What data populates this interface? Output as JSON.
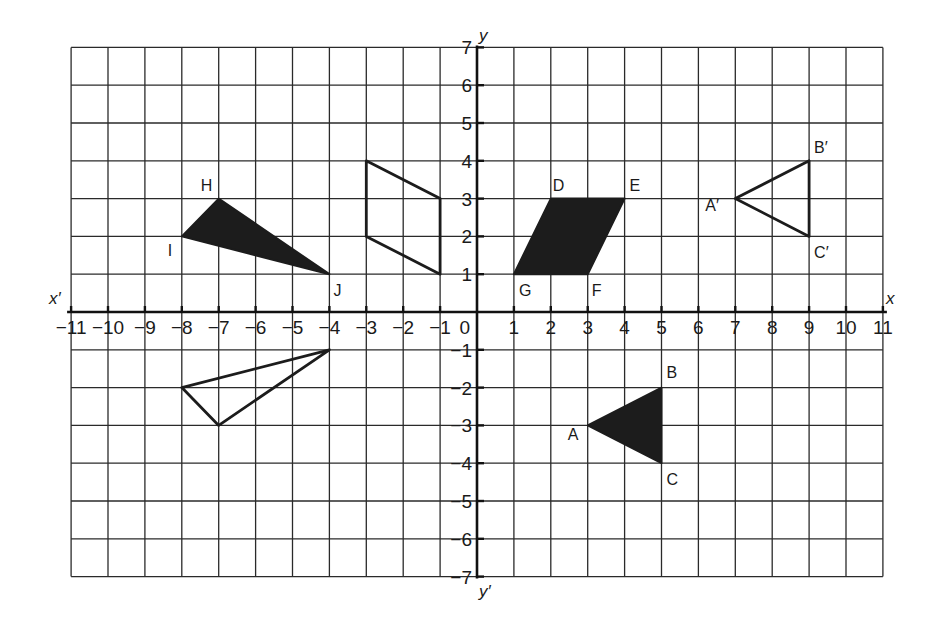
{
  "diagram": {
    "type": "coordinate-plane-transformations",
    "axes": {
      "x_label": "x",
      "x_neg_label": "x′",
      "y_label": "y",
      "y_neg_label": "y′",
      "origin_label": "0",
      "x_range": [
        -11,
        11
      ],
      "y_range": [
        -7,
        7
      ],
      "x_ticks": [
        "−11",
        "−10",
        "−9",
        "−8",
        "−7",
        "−6",
        "−5",
        "−4",
        "−3",
        "−2",
        "−1",
        "1",
        "2",
        "3",
        "4",
        "5",
        "6",
        "7",
        "8",
        "9",
        "10",
        "11"
      ],
      "y_ticks": [
        "7",
        "6",
        "5",
        "4",
        "3",
        "2",
        "1",
        "−1",
        "−2",
        "−3",
        "−4",
        "−5",
        "−6",
        "−7"
      ]
    },
    "shapes": [
      {
        "id": "triangle-HIJ",
        "style": "filled",
        "vertices": [
          {
            "label": "H",
            "x": -7,
            "y": 3
          },
          {
            "label": "I",
            "x": -8,
            "y": 2
          },
          {
            "label": "J",
            "x": -4,
            "y": 1
          }
        ]
      },
      {
        "id": "triangle-HIJ-image",
        "style": "outline",
        "vertices": [
          {
            "label": "",
            "x": -7,
            "y": -3
          },
          {
            "label": "",
            "x": -8,
            "y": -2
          },
          {
            "label": "",
            "x": -4,
            "y": -1
          }
        ]
      },
      {
        "id": "parallelogram-DEFG",
        "style": "filled",
        "vertices": [
          {
            "label": "D",
            "x": 2,
            "y": 3
          },
          {
            "label": "E",
            "x": 4,
            "y": 3
          },
          {
            "label": "F",
            "x": 3,
            "y": 1
          },
          {
            "label": "G",
            "x": 1,
            "y": 1
          }
        ]
      },
      {
        "id": "parallelogram-DEFG-image",
        "style": "outline",
        "vertices": [
          {
            "label": "",
            "x": -3,
            "y": 4
          },
          {
            "label": "",
            "x": -1,
            "y": 3
          },
          {
            "label": "",
            "x": -1,
            "y": 1
          },
          {
            "label": "",
            "x": -3,
            "y": 2
          }
        ]
      },
      {
        "id": "triangle-ABC",
        "style": "filled",
        "vertices": [
          {
            "label": "A",
            "x": 3,
            "y": -3
          },
          {
            "label": "B",
            "x": 5,
            "y": -2
          },
          {
            "label": "C",
            "x": 5,
            "y": -4
          }
        ]
      },
      {
        "id": "triangle-ABC-image",
        "style": "outline",
        "vertices": [
          {
            "label": "A′",
            "x": 7,
            "y": 3
          },
          {
            "label": "B′",
            "x": 9,
            "y": 4
          },
          {
            "label": "C′",
            "x": 9,
            "y": 2
          }
        ]
      }
    ],
    "colors": {
      "ink": "#1c1c1c",
      "grid": "#2a2a2a",
      "background": "#ffffff"
    }
  }
}
